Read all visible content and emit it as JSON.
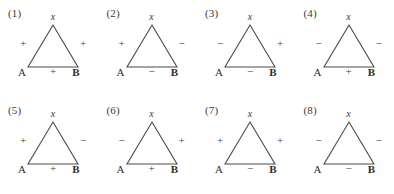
{
  "figure": {
    "background_color": "#ffffff",
    "line_color": "#4a4a4a",
    "text_color": "#333333",
    "apex_label": "x",
    "vertex_left_label": "A",
    "vertex_right_label": "B",
    "panels": [
      {
        "number": "(1)",
        "apex": "x",
        "vertex_left": "A",
        "vertex_right": "B",
        "sign_left": "+",
        "sign_right": "+",
        "sign_bottom": "+"
      },
      {
        "number": "(2)",
        "apex": "x",
        "vertex_left": "A",
        "vertex_right": "B",
        "sign_left": "+",
        "sign_right": "−",
        "sign_bottom": "−"
      },
      {
        "number": "(3)",
        "apex": "x",
        "vertex_left": "A",
        "vertex_right": "B",
        "sign_left": "−",
        "sign_right": "+",
        "sign_bottom": "−"
      },
      {
        "number": "(4)",
        "apex": "x",
        "vertex_left": "A",
        "vertex_right": "B",
        "sign_left": "−",
        "sign_right": "−",
        "sign_bottom": "+"
      },
      {
        "number": "(5)",
        "apex": "x",
        "vertex_left": "A",
        "vertex_right": "B",
        "sign_left": "+",
        "sign_right": "−",
        "sign_bottom": "+"
      },
      {
        "number": "(6)",
        "apex": "x",
        "vertex_left": "A",
        "vertex_right": "B",
        "sign_left": "−",
        "sign_right": "+",
        "sign_bottom": "+"
      },
      {
        "number": "(7)",
        "apex": "x",
        "vertex_left": "A",
        "vertex_right": "B",
        "sign_left": "+",
        "sign_right": "+",
        "sign_bottom": "−"
      },
      {
        "number": "(8)",
        "apex": "x",
        "vertex_left": "A",
        "vertex_right": "B",
        "sign_left": "−",
        "sign_right": "−",
        "sign_bottom": "−"
      }
    ]
  }
}
